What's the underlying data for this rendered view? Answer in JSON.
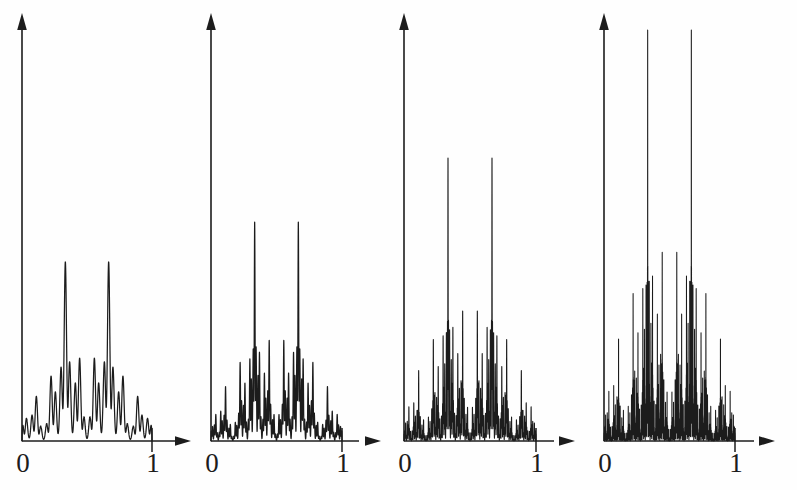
{
  "figure": {
    "background_color": "#fefefe",
    "ink_color": "#1c1c1c",
    "width": 797,
    "height": 490,
    "panel_count": 4
  },
  "axis": {
    "x_label_left": "0",
    "x_label_right": "1",
    "origin_label": "0",
    "unit_label": "1",
    "arrow_x_name": "x-axis-arrow",
    "arrow_y_name": "y-axis-arrow"
  },
  "panels": [
    {
      "index": 1,
      "name": "panel-1",
      "level": 3,
      "origin_x": 22,
      "baseline_y": 441,
      "unit_x": 152,
      "axis_top_y": 15,
      "axis_right_x": 191,
      "peak_y": 262,
      "peak_height_px": 179,
      "label_left": "0",
      "label_right": "1"
    },
    {
      "index": 2,
      "name": "panel-2",
      "level": 4,
      "origin_x": 211,
      "baseline_y": 441,
      "unit_x": 342,
      "axis_top_y": 15,
      "axis_right_x": 381,
      "peak_y": 222,
      "peak_height_px": 219,
      "label_left": "0",
      "label_right": "1"
    },
    {
      "index": 3,
      "name": "panel-3",
      "level": 5,
      "origin_x": 404,
      "baseline_y": 441,
      "unit_x": 536,
      "axis_top_y": 15,
      "axis_right_x": 575,
      "peak_y": 158,
      "peak_height_px": 283,
      "label_left": "0",
      "label_right": "1"
    },
    {
      "index": 4,
      "name": "panel-4",
      "level": 6,
      "origin_x": 604,
      "baseline_y": 441,
      "unit_x": 735,
      "axis_top_y": 15,
      "axis_right_x": 774,
      "peak_y": 30,
      "peak_height_px": 411,
      "label_left": "0",
      "label_right": "1"
    }
  ],
  "chart_data": {
    "type": "line",
    "xlabel": "",
    "ylabel": "",
    "xlim": [
      0,
      1
    ],
    "grid": false,
    "legend": "none",
    "xticks": [
      0,
      1
    ],
    "xticklabels": [
      "0",
      "1"
    ],
    "series": [
      {
        "name": "level-3",
        "panel": 1,
        "factors": 3,
        "base": 3,
        "formula": "f3(x) = sin(pi*x) * prod_{k=1..3} (1 + 0.5*cos(2*pi*3^k*x)) / 3.375",
        "max_value": 1.0,
        "samples_x": [
          0.0,
          0.05,
          0.1,
          0.15,
          0.2,
          0.25,
          0.3,
          0.35,
          0.4,
          0.45,
          0.5,
          0.55,
          0.6,
          0.65,
          0.7,
          0.75,
          0.8,
          0.85,
          0.9,
          0.95,
          1.0
        ],
        "samples_y": [
          0.0,
          0.23,
          0.45,
          0.55,
          0.62,
          0.72,
          0.88,
          0.96,
          0.92,
          0.72,
          0.55,
          0.72,
          0.92,
          0.96,
          0.88,
          0.72,
          0.62,
          0.55,
          0.45,
          0.23,
          0.0
        ]
      },
      {
        "name": "level-4",
        "panel": 2,
        "factors": 4,
        "base": 3,
        "formula": "f4(x) = sin(pi*x) * prod_{k=1..4} (1 + 0.55*cos(2*pi*3^k*x)) / 5.06",
        "max_value": 1.0,
        "samples_x": [
          0.0,
          0.05,
          0.1,
          0.15,
          0.2,
          0.25,
          0.3,
          0.35,
          0.4,
          0.45,
          0.5,
          0.55,
          0.6,
          0.65,
          0.7,
          0.75,
          0.8,
          0.85,
          0.9,
          0.95,
          1.0
        ],
        "samples_y": [
          0.0,
          0.3,
          0.5,
          0.6,
          0.68,
          0.78,
          0.92,
          1.0,
          0.94,
          0.7,
          0.48,
          0.7,
          0.94,
          1.0,
          0.92,
          0.78,
          0.68,
          0.6,
          0.5,
          0.3,
          0.0
        ]
      },
      {
        "name": "level-5",
        "panel": 3,
        "factors": 5,
        "base": 3,
        "formula": "f5(x) = sin(pi*x) * prod_{k=1..5} (1 + 0.6*cos(2*pi*3^k*x)) / 7.6",
        "max_value": 1.0,
        "samples_x": [
          0.0,
          0.05,
          0.1,
          0.15,
          0.2,
          0.25,
          0.3,
          0.35,
          0.4,
          0.45,
          0.5,
          0.55,
          0.6,
          0.65,
          0.7,
          0.75,
          0.8,
          0.85,
          0.9,
          0.95,
          1.0
        ],
        "samples_y": [
          0.0,
          0.33,
          0.55,
          0.64,
          0.72,
          0.82,
          0.95,
          1.0,
          0.95,
          0.68,
          0.42,
          0.68,
          0.95,
          1.0,
          0.95,
          0.82,
          0.72,
          0.64,
          0.55,
          0.33,
          0.0
        ]
      },
      {
        "name": "level-6",
        "panel": 4,
        "factors": 6,
        "base": 3,
        "formula": "f6(x) = sin(pi*x) * prod_{k=1..6} (1 + 0.65*cos(2*pi*3^k*x)) / 11.4",
        "max_value": 1.0,
        "samples_x": [
          0.0,
          0.05,
          0.1,
          0.15,
          0.2,
          0.25,
          0.3,
          0.35,
          0.4,
          0.45,
          0.5,
          0.55,
          0.6,
          0.65,
          0.7,
          0.75,
          0.8,
          0.85,
          0.9,
          0.95,
          1.0
        ],
        "samples_y": [
          0.0,
          0.36,
          0.6,
          0.68,
          0.76,
          0.86,
          0.97,
          1.0,
          0.96,
          0.64,
          0.35,
          0.64,
          0.96,
          1.0,
          0.97,
          0.86,
          0.76,
          0.68,
          0.6,
          0.36,
          0.0
        ]
      }
    ]
  }
}
